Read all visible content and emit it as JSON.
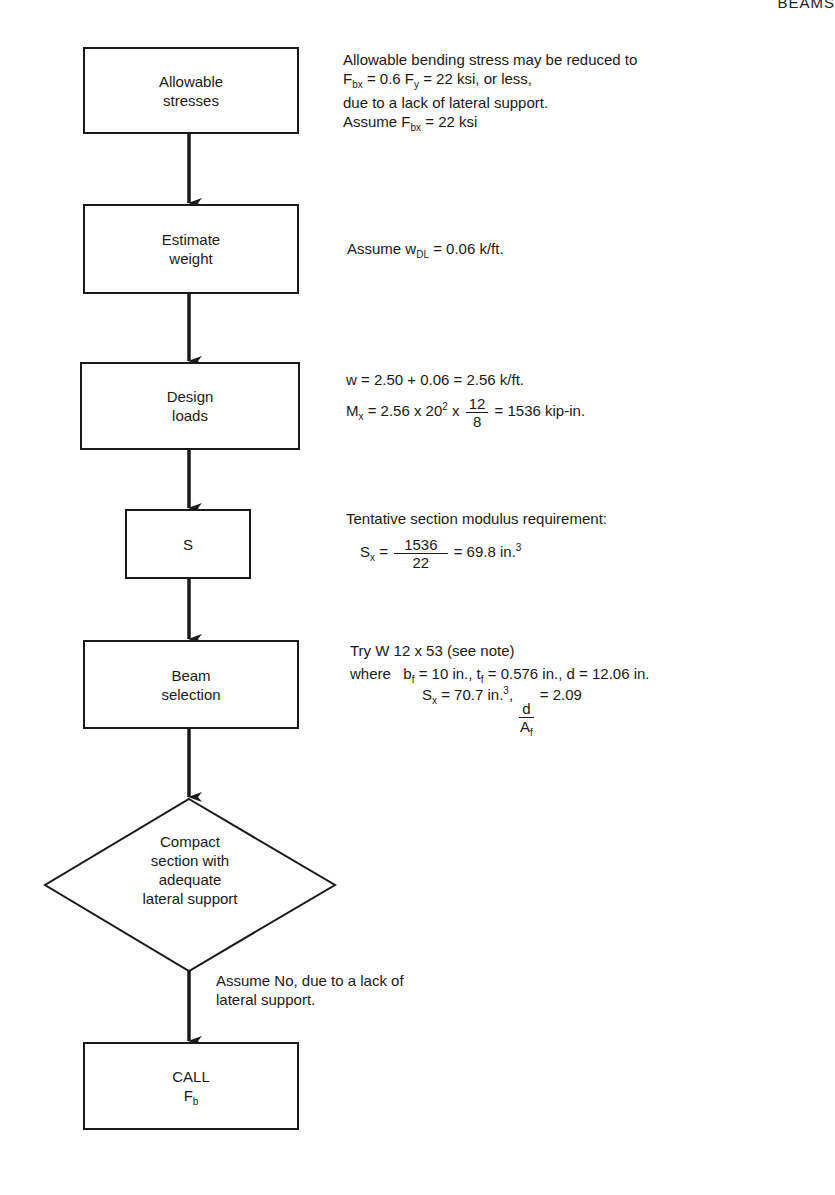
{
  "header": {
    "running_title": "BEAMS"
  },
  "flowchart": {
    "steps": [
      {
        "id": "allowable-stresses",
        "shape": "rectangle",
        "lines": [
          "Allowable",
          "stresses"
        ]
      },
      {
        "id": "estimate-weight",
        "shape": "rectangle",
        "lines": [
          "Estimate",
          "weight"
        ]
      },
      {
        "id": "design-loads",
        "shape": "rectangle",
        "lines": [
          "Design",
          "loads"
        ]
      },
      {
        "id": "s",
        "shape": "rectangle",
        "lines": [
          "S"
        ]
      },
      {
        "id": "beam-selection",
        "shape": "rectangle",
        "lines": [
          "Beam",
          "selection"
        ]
      },
      {
        "id": "compact-section",
        "shape": "diamond",
        "lines": [
          "Compact",
          "section with",
          "adequate",
          "lateral support"
        ]
      },
      {
        "id": "call-fb",
        "shape": "rectangle",
        "lines": [
          "CALL",
          "F",
          "b"
        ]
      }
    ],
    "decision_branch_label": [
      "Assume No, due to a lack of",
      "lateral support."
    ]
  },
  "notes": {
    "allowable_stresses": {
      "line1": "Allowable bending stress may be reduced to",
      "line2": {
        "F": "F",
        "sub1": "bx",
        "mid": " = 0.6 F",
        "sub2": "y",
        "tail": " = 22 ksi, or less,"
      },
      "line3": "due to a lack of lateral support.",
      "line4": {
        "pre": "Assume F",
        "sub": "bx",
        "tail": " = 22 ksi"
      }
    },
    "estimate_weight": {
      "pre": "Assume w",
      "sub": "DL",
      "tail": " = 0.06 k/ft."
    },
    "design_loads": {
      "line1": "w = 2.50 + 0.06 = 2.56 k/ft.",
      "line2": {
        "pre": "M",
        "sub": "x",
        "mid": " = 2.56 x 20",
        "sup": "2",
        "mid2": " x ",
        "num": "12",
        "den": "8",
        "tail": " = 1536 kip-in."
      }
    },
    "s": {
      "line1": "Tentative section modulus requirement:",
      "line2": {
        "pre": "S",
        "sub": "x",
        "eq": " = ",
        "num": "1536",
        "den": "22",
        "tail": " = 69.8 in.",
        "sup": "3"
      }
    },
    "beam_selection": {
      "line1": "Try W 12 x 53 (see note)",
      "line2": {
        "pre": "where   b",
        "sub1": "f",
        "mid1": " = 10 in., t",
        "sub2": "f",
        "tail": " = 0.576 in., d = 12.06 in."
      },
      "line3": {
        "pre": "S",
        "sub": "x",
        "mid": " = 70.7 in.",
        "sup": "3",
        "comma": ", ",
        "num": "d",
        "den": "A",
        "den_sub": "f",
        "tail": " = 2.09"
      }
    }
  }
}
